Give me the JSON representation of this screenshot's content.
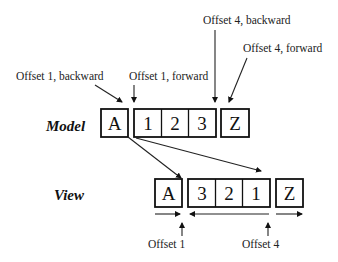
{
  "diagram": {
    "rows": {
      "model": {
        "label": "Model",
        "cells": [
          "A",
          "1",
          "2",
          "3",
          "Z"
        ]
      },
      "view": {
        "label": "View",
        "cells": [
          "A",
          "3",
          "2",
          "1",
          "Z"
        ]
      }
    },
    "annotations": {
      "offset1_backward": "Offset 1, backward",
      "offset1_forward": "Offset 1, forward",
      "offset4_backward": "Offset 4, backward",
      "offset4_forward": "Offset 4, forward",
      "offset1": "Offset 1",
      "offset4": "Offset 4"
    },
    "colors": {
      "stroke": "#111111",
      "background": "#ffffff"
    }
  }
}
